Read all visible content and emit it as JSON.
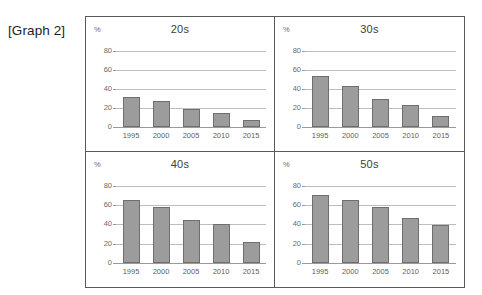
{
  "caption": "[Graph 2]",
  "axis": {
    "unit_label": "%",
    "yticks": [
      0,
      20,
      40,
      60,
      80
    ],
    "ylim": [
      0,
      90
    ],
    "years": [
      "1995",
      "2000",
      "2005",
      "2010",
      "2015"
    ]
  },
  "colors": {
    "bar_fill": "#9c9c9c",
    "bar_stroke": "#6f6f6f",
    "gridline": "#bdbdbd",
    "frame_border": "#5a5a5a",
    "text": "#3d3d3d"
  },
  "chart_data": [
    {
      "type": "bar",
      "title": "20s",
      "categories": [
        "1995",
        "2000",
        "2005",
        "2010",
        "2015"
      ],
      "values": [
        31,
        27,
        19,
        15,
        7
      ],
      "xlabel": "",
      "ylabel": "%",
      "ylim": [
        0,
        90
      ],
      "yticks": [
        0,
        20,
        40,
        60,
        80
      ],
      "grid": true,
      "legend": "none"
    },
    {
      "type": "bar",
      "title": "30s",
      "categories": [
        "1995",
        "2000",
        "2005",
        "2010",
        "2015"
      ],
      "values": [
        53,
        43,
        29,
        23,
        12
      ],
      "xlabel": "",
      "ylabel": "%",
      "ylim": [
        0,
        90
      ],
      "yticks": [
        0,
        20,
        40,
        60,
        80
      ],
      "grid": true,
      "legend": "none"
    },
    {
      "type": "bar",
      "title": "40s",
      "categories": [
        "1995",
        "2000",
        "2005",
        "2010",
        "2015"
      ],
      "values": [
        65,
        58,
        44,
        40,
        22
      ],
      "xlabel": "",
      "ylabel": "%",
      "ylim": [
        0,
        90
      ],
      "yticks": [
        0,
        20,
        40,
        60,
        80
      ],
      "grid": true,
      "legend": "none"
    },
    {
      "type": "bar",
      "title": "50s",
      "categories": [
        "1995",
        "2000",
        "2005",
        "2010",
        "2015"
      ],
      "values": [
        70,
        65,
        58,
        47,
        39
      ],
      "xlabel": "",
      "ylabel": "%",
      "ylim": [
        0,
        90
      ],
      "yticks": [
        0,
        20,
        40,
        60,
        80
      ],
      "grid": true,
      "legend": "none"
    }
  ]
}
